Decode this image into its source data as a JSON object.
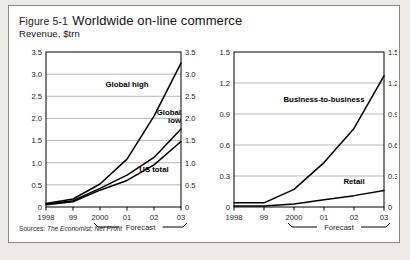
{
  "figure": {
    "number": "Figure 5-1",
    "title": "Worldwide on-line commerce",
    "subtitle": "Revenue, $trn",
    "sources_label": "Sources:",
    "sources_value": "The Economist; Net Profit",
    "frame_color": "#8a8a86",
    "background": "#ffffff",
    "page_background": "#eceae6",
    "line_color": "#000000",
    "grid_color": "#b8b8b8"
  },
  "chart_data": [
    {
      "type": "line",
      "id": "left",
      "title": "",
      "xlabel": "",
      "ylabel": "Revenue, $trn",
      "x": [
        "1998",
        "99",
        "2000",
        "01",
        "02",
        "03"
      ],
      "xtick_labels": [
        "1998",
        "99",
        "2000",
        "01",
        "02",
        "03"
      ],
      "ytick_labels": [
        "0",
        "0.5",
        "1.0",
        "1.5",
        "2.0",
        "2.5",
        "3.0",
        "3.5"
      ],
      "ytick_values": [
        0,
        0.5,
        1.0,
        1.5,
        2.0,
        2.5,
        3.0,
        3.5
      ],
      "ylim": [
        0,
        3.5
      ],
      "grid": true,
      "dual_axis": true,
      "forecast_label": "Forecast",
      "forecast_from": "2000",
      "forecast_to": "03",
      "series": [
        {
          "name": "Global high",
          "values": [
            0.08,
            0.18,
            0.52,
            1.08,
            2.05,
            3.25
          ],
          "label_x": "01",
          "label_y": 2.72
        },
        {
          "name": "Global low",
          "values": [
            0.06,
            0.14,
            0.42,
            0.72,
            1.12,
            1.76
          ],
          "label_x": "03",
          "label_y": 2.08
        },
        {
          "name": "US total",
          "values": [
            0.05,
            0.12,
            0.38,
            0.6,
            0.95,
            1.48
          ],
          "label_x": "02",
          "label_y": 0.8
        }
      ]
    },
    {
      "type": "line",
      "id": "right",
      "title": "",
      "xlabel": "",
      "ylabel": "",
      "x": [
        "1998",
        "99",
        "2000",
        "01",
        "02",
        "03"
      ],
      "xtick_labels": [
        "1998",
        "99",
        "2000",
        "01",
        "02",
        "03"
      ],
      "ytick_labels": [
        "0",
        "0.3",
        "0.6",
        "0.9",
        "1.2",
        "1.5"
      ],
      "ytick_values": [
        0,
        0.3,
        0.6,
        0.9,
        1.2,
        1.5
      ],
      "ylim": [
        0,
        1.5
      ],
      "grid": true,
      "dual_axis": true,
      "forecast_label": "Forecast",
      "forecast_from": "2000",
      "forecast_to": "03",
      "series": [
        {
          "name": "Business-to-business",
          "values": [
            0.04,
            0.04,
            0.17,
            0.43,
            0.76,
            1.27
          ],
          "label_x": "01",
          "label_y": 1.02
        },
        {
          "name": "Retail",
          "values": [
            0.01,
            0.01,
            0.03,
            0.07,
            0.11,
            0.16
          ],
          "label_x": "02",
          "label_y": 0.22
        }
      ]
    }
  ]
}
